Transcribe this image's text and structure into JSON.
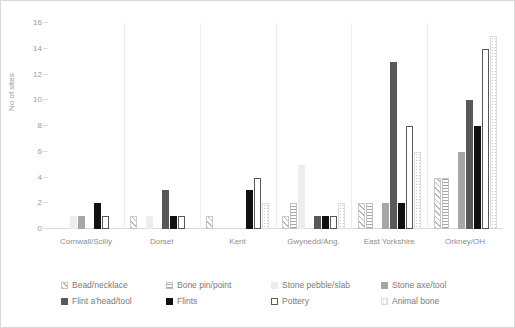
{
  "chart_data": {
    "type": "bar",
    "title": "",
    "xlabel": "",
    "ylabel": "No of sites",
    "ylim": [
      0,
      16
    ],
    "yticks": [
      0,
      2,
      4,
      6,
      8,
      10,
      12,
      14,
      16
    ],
    "grid": false,
    "legend_position": "bottom",
    "categories": [
      "Cornwall/Scilly",
      "Dorset",
      "Kent",
      "Gwynedd/Ang.",
      "East Yorkshire",
      "Orkney/OH"
    ],
    "series": [
      {
        "name": "Bead/necklace",
        "key": "bead",
        "pattern": "diagonal-hatch",
        "color": "#c8c8c8",
        "values": [
          0,
          1,
          1,
          1,
          2,
          4
        ]
      },
      {
        "name": "Bone pin/point",
        "key": "bonepin",
        "pattern": "horizontal-lines",
        "color": "#a8a8a8",
        "values": [
          0,
          0,
          0,
          2,
          2,
          4
        ]
      },
      {
        "name": "Stone pebble/slab",
        "key": "pebble",
        "pattern": "solid-light-grey",
        "color": "#ededed",
        "values": [
          1,
          1,
          0,
          5,
          0,
          0
        ]
      },
      {
        "name": "Stone axe/tool",
        "key": "axe",
        "pattern": "solid-mid-grey",
        "color": "#a6a6a6",
        "values": [
          1,
          0,
          0,
          0,
          2,
          6
        ]
      },
      {
        "name": "Flint a'head/tool",
        "key": "flinthead",
        "pattern": "solid-dark-grey",
        "color": "#595959",
        "values": [
          0,
          3,
          0,
          1,
          13,
          10
        ]
      },
      {
        "name": "Flints",
        "key": "flints",
        "pattern": "solid-black",
        "color": "#111111",
        "values": [
          2,
          1,
          3,
          1,
          2,
          8
        ]
      },
      {
        "name": "Pottery",
        "key": "pottery",
        "pattern": "outline-white",
        "color": "#ffffff",
        "values": [
          1,
          1,
          4,
          1,
          8,
          14
        ]
      },
      {
        "name": "Animal bone",
        "key": "animal",
        "pattern": "dotted-light",
        "color": "#dcdcdc",
        "values": [
          0,
          0,
          2,
          2,
          6,
          15
        ]
      }
    ]
  },
  "legend": {
    "items": [
      {
        "label": "Bead/necklace",
        "swatch": "p-bead"
      },
      {
        "label": "Bone pin/point",
        "swatch": "p-bonepin"
      },
      {
        "label": "Stone pebble/slab",
        "swatch": "p-pebble"
      },
      {
        "label": "Stone axe/tool",
        "swatch": "p-axe"
      },
      {
        "label": "Flint a'head/tool",
        "swatch": "p-flinthead"
      },
      {
        "label": "Flints",
        "swatch": "p-flints"
      },
      {
        "label": "Pottery",
        "swatch": "p-pottery"
      },
      {
        "label": "Animal bone",
        "swatch": "p-animal"
      }
    ]
  }
}
